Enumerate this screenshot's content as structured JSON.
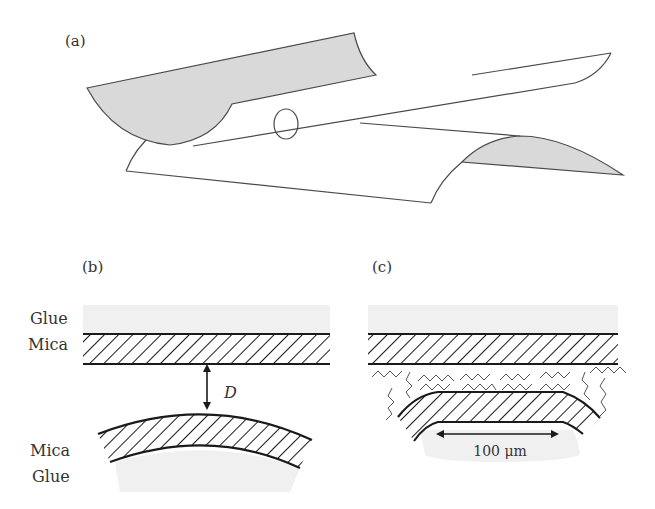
{
  "figure": {
    "panels": [
      {
        "id": "a",
        "label": "(a)",
        "description": "Two crossed cylindrical mica surfaces with contact point circled"
      },
      {
        "id": "b",
        "label": "(b)",
        "description": "Cross-section of mica surfaces separated by distance D"
      },
      {
        "id": "c",
        "label": "(c)",
        "description": "Flattened contact region with adsorbed molecules"
      }
    ],
    "panel_b": {
      "top_labels": [
        "Glue",
        "Mica"
      ],
      "bottom_labels": [
        "Mica",
        "Glue"
      ],
      "distance_label": "D"
    },
    "panel_c": {
      "scale_label": "100 μm"
    },
    "colors": {
      "surface_fill": "#d9d9d9",
      "glue_fill": "#f0f0f0",
      "line": "#1a1a1a",
      "thin_line": "#4a4a4a"
    },
    "icons": {
      "contact_circle": "contact-circle-icon",
      "distance_arrow": "double-arrow-icon",
      "scale_arrow": "double-arrow-icon"
    }
  }
}
